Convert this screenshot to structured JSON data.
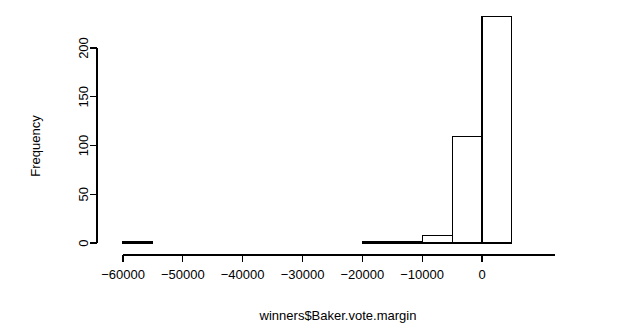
{
  "chart_data": {
    "type": "bar",
    "chart_kind": "histogram",
    "title": "",
    "xlabel": "winners$Baker.vote.margin",
    "ylabel": "Frequency",
    "xlim": [
      -62500,
      7500
    ],
    "ylim": [
      0,
      235
    ],
    "bin_width": 5000,
    "grid": false,
    "legend": null,
    "x_ticks": [
      -60000,
      -50000,
      -40000,
      -30000,
      -20000,
      -10000,
      0
    ],
    "x_tick_labels": [
      "-60000",
      "-50000",
      "-40000",
      "-30000",
      "-20000",
      "-10000",
      "0"
    ],
    "y_ticks": [
      0,
      50,
      100,
      150,
      200
    ],
    "y_tick_labels": [
      "0",
      "50",
      "100",
      "150",
      "200"
    ],
    "bins": [
      {
        "start": -60000,
        "end": -55000,
        "count": 1
      },
      {
        "start": -55000,
        "end": -50000,
        "count": 0
      },
      {
        "start": -50000,
        "end": -45000,
        "count": 0
      },
      {
        "start": -45000,
        "end": -40000,
        "count": 0
      },
      {
        "start": -40000,
        "end": -35000,
        "count": 0
      },
      {
        "start": -35000,
        "end": -30000,
        "count": 0
      },
      {
        "start": -30000,
        "end": -25000,
        "count": 0
      },
      {
        "start": -25000,
        "end": -20000,
        "count": 0
      },
      {
        "start": -20000,
        "end": -15000,
        "count": 1
      },
      {
        "start": -15000,
        "end": -10000,
        "count": 1
      },
      {
        "start": -10000,
        "end": -5000,
        "count": 8
      },
      {
        "start": -5000,
        "end": 0,
        "count": 109
      },
      {
        "start": 0,
        "end": 5000,
        "count": 232
      }
    ]
  },
  "axes": {
    "y_axis_label": "Frequency",
    "x_axis_label": "winners$Baker.vote.margin"
  }
}
